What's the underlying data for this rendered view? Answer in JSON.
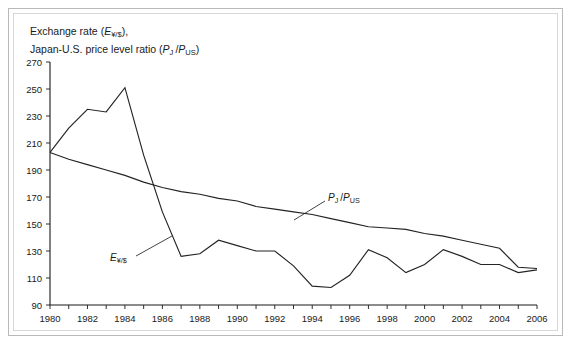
{
  "chart_data": {
    "type": "line",
    "title_lines": [
      "Exchange rate (E¥/$),",
      "Japan-U.S. price level ratio (PJ /PUS)"
    ],
    "xlabel": "",
    "ylabel": "",
    "xlim": [
      1980,
      2006
    ],
    "ylim": [
      90,
      270
    ],
    "ytick_step": 20,
    "xtick_step": 1,
    "grid": false,
    "legend_position": "inline-annotation",
    "yticks": [
      90,
      110,
      130,
      150,
      170,
      190,
      210,
      230,
      250,
      270
    ],
    "xticks": [
      1980,
      1981,
      1982,
      1983,
      1984,
      1985,
      1986,
      1987,
      1988,
      1989,
      1990,
      1991,
      1992,
      1993,
      1994,
      1995,
      1996,
      1997,
      1998,
      1999,
      2000,
      2001,
      2002,
      2003,
      2004,
      2005,
      2006
    ],
    "xtick_labels": [
      "1980",
      "",
      "1982",
      "",
      "1984",
      "",
      "1986",
      "",
      "1988",
      "",
      "1990",
      "",
      "1992",
      "",
      "1994",
      "",
      "1996",
      "",
      "1998",
      "",
      "2000",
      "",
      "2002",
      "",
      "2004",
      "",
      "2006"
    ],
    "x": [
      1980,
      1981,
      1982,
      1983,
      1984,
      1985,
      1986,
      1987,
      1988,
      1989,
      1990,
      1991,
      1992,
      1993,
      1994,
      1995,
      1996,
      1997,
      1998,
      1999,
      2000,
      2001,
      2002,
      2003,
      2004,
      2005,
      2006
    ],
    "series": [
      {
        "name": "exchange-rate",
        "label": "E¥/$",
        "values": [
          203,
          221,
          235,
          233,
          251,
          201,
          159,
          126,
          128,
          138,
          134,
          130,
          130,
          119,
          104,
          103,
          112,
          131,
          125,
          114,
          120,
          131,
          126,
          120,
          120,
          114,
          116
        ]
      },
      {
        "name": "price-level-ratio",
        "label": "PJ /PUS",
        "values": [
          203,
          198,
          194,
          190,
          186,
          181,
          177,
          174,
          172,
          169,
          167,
          163,
          161,
          159,
          157,
          154,
          151,
          148,
          147,
          146,
          143,
          141,
          138,
          135,
          132,
          118,
          117
        ]
      }
    ],
    "annotations": [
      {
        "name": "exchange-rate-annotation",
        "label": "E¥/$",
        "x_px": 110,
        "y_px": 252
      },
      {
        "name": "price-ratio-annotation",
        "label": "PJ /PUS",
        "x_px": 328,
        "y_px": 192
      }
    ]
  },
  "figure": {
    "plot_left_px": 50,
    "plot_right_px": 537,
    "plot_top_px": 62,
    "plot_bottom_px": 305
  }
}
